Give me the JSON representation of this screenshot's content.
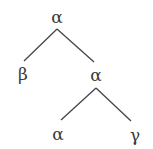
{
  "diagram": {
    "type": "tree",
    "nodes": [
      {
        "id": "root",
        "label": "α",
        "x": 57,
        "y": 17
      },
      {
        "id": "left",
        "label": "β",
        "x": 23,
        "y": 74
      },
      {
        "id": "mid",
        "label": "α",
        "x": 96,
        "y": 75
      },
      {
        "id": "midleft",
        "label": "α",
        "x": 58,
        "y": 134
      },
      {
        "id": "midright",
        "label": "γ",
        "x": 135,
        "y": 135
      }
    ],
    "edges": [
      {
        "from": "root",
        "to": "left"
      },
      {
        "from": "root",
        "to": "mid"
      },
      {
        "from": "mid",
        "to": "midleft"
      },
      {
        "from": "mid",
        "to": "midright"
      }
    ],
    "line_color": "#444444"
  }
}
